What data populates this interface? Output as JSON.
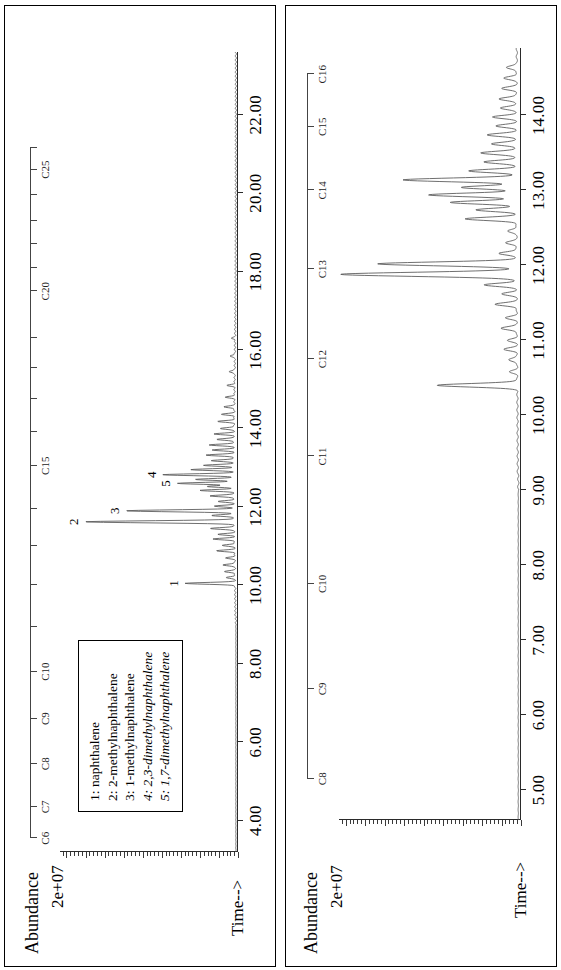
{
  "figure": {
    "orientation": "rotated-90",
    "panel_count": 2,
    "background": "#ffffff",
    "trace_color": "#555555",
    "axis_color": "#2a2a2a"
  },
  "legend": {
    "border_color": "#000000",
    "entries": [
      {
        "index": "1:",
        "name": "naphthalene",
        "italic": false
      },
      {
        "index": "2:",
        "name": "2-methylnaphthalene",
        "italic": false
      },
      {
        "index": "3:",
        "name": "1-methylnaphthalene",
        "italic": false
      },
      {
        "index": "4:",
        "name": "2,3-dimethylnaphthalene",
        "italic": true
      },
      {
        "index": "5:",
        "name": "1,7-dimethylnaphthalene",
        "italic": true
      }
    ]
  },
  "chart_data": [
    {
      "id": "panel-top",
      "type": "line",
      "title": "",
      "ylabel": "Abundance",
      "yscale_label": "2e+07",
      "xlabel": "Time-->",
      "xlim": [
        3.2,
        23.6
      ],
      "ylim": [
        0,
        1.0
      ],
      "xticks": [
        4.0,
        6.0,
        8.0,
        10.0,
        12.0,
        14.0,
        16.0,
        18.0,
        20.0,
        22.0
      ],
      "xticklabels": [
        "4.00",
        "6.00",
        "8.00",
        "10.00",
        "12.00",
        "14.00",
        "16.00",
        "18.00",
        "20.00",
        "22.00"
      ],
      "grid": false,
      "legend_position": "top-left",
      "carbon_ruler": {
        "labels": [
          "C6",
          "C7",
          "C8",
          "C9",
          "C10",
          "C15",
          "C20",
          "C25"
        ],
        "positions": [
          3.55,
          4.35,
          5.45,
          6.6,
          7.8,
          13.05,
          17.5,
          20.6
        ],
        "minor_positions": [
          8.95,
          10.0,
          11.0,
          11.95,
          13.9,
          14.75,
          15.55,
          16.3,
          18.1,
          18.7,
          19.3,
          19.95,
          21.15
        ]
      },
      "peak_annotations": [
        {
          "label": "1",
          "x": 10.05,
          "y": 0.3
        },
        {
          "label": "2",
          "x": 11.62,
          "y": 0.86
        },
        {
          "label": "3",
          "x": 11.9,
          "y": 0.63
        },
        {
          "label": "4",
          "x": 12.82,
          "y": 0.42
        },
        {
          "label": "5",
          "x": 12.6,
          "y": 0.34
        }
      ],
      "peaks": [
        {
          "x": 10.05,
          "h": 0.28
        },
        {
          "x": 10.2,
          "h": 0.05
        },
        {
          "x": 10.35,
          "h": 0.06
        },
        {
          "x": 10.52,
          "h": 0.07
        },
        {
          "x": 10.7,
          "h": 0.05
        },
        {
          "x": 10.88,
          "h": 0.1
        },
        {
          "x": 11.02,
          "h": 0.07
        },
        {
          "x": 11.18,
          "h": 0.12
        },
        {
          "x": 11.3,
          "h": 0.09
        },
        {
          "x": 11.45,
          "h": 0.14
        },
        {
          "x": 11.62,
          "h": 0.84
        },
        {
          "x": 11.78,
          "h": 0.13
        },
        {
          "x": 11.9,
          "h": 0.61
        },
        {
          "x": 12.02,
          "h": 0.11
        },
        {
          "x": 12.14,
          "h": 0.09
        },
        {
          "x": 12.28,
          "h": 0.14
        },
        {
          "x": 12.42,
          "h": 0.19
        },
        {
          "x": 12.52,
          "h": 0.15
        },
        {
          "x": 12.6,
          "h": 0.32
        },
        {
          "x": 12.7,
          "h": 0.22
        },
        {
          "x": 12.82,
          "h": 0.4
        },
        {
          "x": 12.95,
          "h": 0.24
        },
        {
          "x": 13.06,
          "h": 0.17
        },
        {
          "x": 13.18,
          "h": 0.13
        },
        {
          "x": 13.32,
          "h": 0.16
        },
        {
          "x": 13.45,
          "h": 0.12
        },
        {
          "x": 13.58,
          "h": 0.14
        },
        {
          "x": 13.72,
          "h": 0.1
        },
        {
          "x": 13.86,
          "h": 0.11
        },
        {
          "x": 14.0,
          "h": 0.08
        },
        {
          "x": 14.18,
          "h": 0.09
        },
        {
          "x": 14.36,
          "h": 0.07
        },
        {
          "x": 14.55,
          "h": 0.06
        },
        {
          "x": 14.8,
          "h": 0.05
        },
        {
          "x": 15.1,
          "h": 0.04
        },
        {
          "x": 15.45,
          "h": 0.035
        },
        {
          "x": 15.85,
          "h": 0.03
        },
        {
          "x": 16.3,
          "h": 0.02
        }
      ],
      "baseline_drift": 0.012
    },
    {
      "id": "panel-bottom",
      "type": "line",
      "title": "",
      "ylabel": "Abundance",
      "yscale_label": "2e+07",
      "xlabel": "Time-->",
      "xlim": [
        4.6,
        14.9
      ],
      "ylim": [
        0,
        1.0
      ],
      "xticks": [
        5.0,
        6.0,
        7.0,
        8.0,
        9.0,
        10.0,
        11.0,
        12.0,
        13.0,
        14.0
      ],
      "xticklabels": [
        "5.00",
        "6.00",
        "7.00",
        "8.00",
        "9.00",
        "10.00",
        "11.00",
        "12.00",
        "13.00",
        "14.00"
      ],
      "grid": false,
      "legend_position": "none",
      "carbon_ruler": {
        "labels": [
          "C8",
          "C9",
          "C10",
          "C11",
          "C12",
          "C13",
          "C14",
          "C15",
          "C16"
        ],
        "positions": [
          5.15,
          6.35,
          7.75,
          9.45,
          10.75,
          11.95,
          13.0,
          13.85,
          14.55
        ],
        "minor_positions": []
      },
      "peak_annotations": [],
      "peaks": [
        {
          "x": 10.4,
          "h": 0.44
        },
        {
          "x": 10.58,
          "h": 0.04
        },
        {
          "x": 10.74,
          "h": 0.05
        },
        {
          "x": 10.88,
          "h": 0.07
        },
        {
          "x": 11.0,
          "h": 0.05
        },
        {
          "x": 11.16,
          "h": 0.09
        },
        {
          "x": 11.3,
          "h": 0.06
        },
        {
          "x": 11.48,
          "h": 0.12
        },
        {
          "x": 11.62,
          "h": 0.08
        },
        {
          "x": 11.74,
          "h": 0.18
        },
        {
          "x": 11.88,
          "h": 0.97
        },
        {
          "x": 12.02,
          "h": 0.76
        },
        {
          "x": 12.16,
          "h": 0.1
        },
        {
          "x": 12.3,
          "h": 0.06
        },
        {
          "x": 12.46,
          "h": 0.05
        },
        {
          "x": 12.62,
          "h": 0.28
        },
        {
          "x": 12.74,
          "h": 0.22
        },
        {
          "x": 12.84,
          "h": 0.36
        },
        {
          "x": 12.94,
          "h": 0.48
        },
        {
          "x": 13.04,
          "h": 0.3
        },
        {
          "x": 13.14,
          "h": 0.62
        },
        {
          "x": 13.26,
          "h": 0.26
        },
        {
          "x": 13.38,
          "h": 0.18
        },
        {
          "x": 13.5,
          "h": 0.2
        },
        {
          "x": 13.62,
          "h": 0.14
        },
        {
          "x": 13.74,
          "h": 0.16
        },
        {
          "x": 13.86,
          "h": 0.11
        },
        {
          "x": 13.98,
          "h": 0.13
        },
        {
          "x": 14.1,
          "h": 0.09
        },
        {
          "x": 14.22,
          "h": 0.1
        },
        {
          "x": 14.36,
          "h": 0.08
        },
        {
          "x": 14.5,
          "h": 0.07
        },
        {
          "x": 14.64,
          "h": 0.06
        }
      ],
      "baseline_drift": 0.015
    }
  ]
}
